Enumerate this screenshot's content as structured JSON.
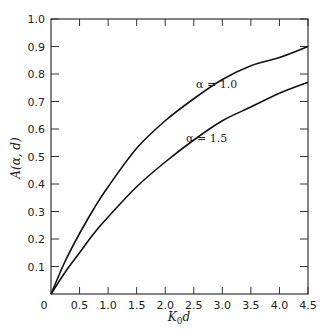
{
  "chart_data": {
    "type": "line",
    "title": "",
    "xlabel": "K₀d",
    "ylabel": "A(α, d)",
    "xlim": [
      0,
      4.5
    ],
    "ylim": [
      0,
      1.0
    ],
    "grid": false,
    "legend": "inline annotations",
    "x_ticks": [
      "0",
      "0.5",
      "1.0",
      "1.5",
      "2.0",
      "2.5",
      "3.0",
      "3.5",
      "4.0",
      "4.5"
    ],
    "y_ticks": [
      "0.1",
      "0.2",
      "0.3",
      "0.4",
      "0.5",
      "0.6",
      "0.7",
      "0.8",
      "0.9",
      "1.0"
    ],
    "x": [
      0,
      0.25,
      0.5,
      0.75,
      1.0,
      1.5,
      2.0,
      2.5,
      3.0,
      3.5,
      4.0,
      4.5
    ],
    "series": [
      {
        "name": "α = 1.0",
        "values": [
          0,
          0.12,
          0.22,
          0.31,
          0.39,
          0.53,
          0.63,
          0.71,
          0.78,
          0.83,
          0.86,
          0.9
        ]
      },
      {
        "name": "α = 1.5",
        "values": [
          0,
          0.08,
          0.15,
          0.22,
          0.28,
          0.39,
          0.48,
          0.56,
          0.63,
          0.68,
          0.73,
          0.77
        ]
      }
    ],
    "annotations": [
      {
        "text": "α = 1.0",
        "x": 2.45,
        "y": 0.75
      },
      {
        "text": "α = 1.5",
        "x": 2.15,
        "y": 0.55
      }
    ]
  },
  "labels": {
    "xlabel_main": "K",
    "xlabel_sub": "0",
    "xlabel_tail": "d",
    "ylabel": "A(α, d)",
    "ann1": "α = 1.0",
    "ann2": "α = 1.5",
    "origin": "0"
  }
}
